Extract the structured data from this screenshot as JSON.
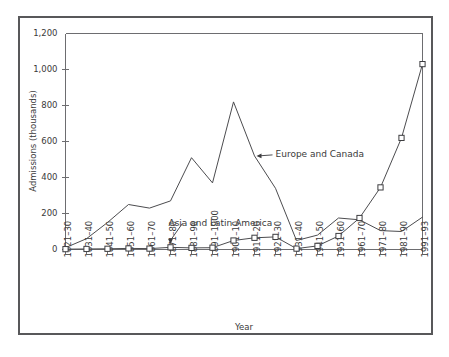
{
  "chart_data": {
    "type": "line",
    "title": "",
    "xlabel": "Year",
    "ylabel": "Admissions (thousands)",
    "ylim": [
      0,
      1200
    ],
    "yticks": [
      0,
      200,
      400,
      600,
      800,
      1000,
      1200
    ],
    "ytick_labels": [
      "0",
      "200",
      "400",
      "600",
      "800",
      "1,000",
      "1,200"
    ],
    "grid": false,
    "legend_position": "inline-annotations",
    "categories": [
      "1821–30",
      "1831–40",
      "1841–50",
      "1851–60",
      "1861–70",
      "1871–80",
      "1881–90",
      "1891–1900",
      "1901–10",
      "1911–20",
      "1921–30",
      "1931–40",
      "1941–50",
      "1951–60",
      "1961–70",
      "1971–80",
      "1981–90",
      "1991–93"
    ],
    "series": [
      {
        "name": "Europe and Canada",
        "marker": "none",
        "values": [
          10,
          60,
          150,
          250,
          230,
          270,
          510,
          370,
          820,
          520,
          340,
          50,
          80,
          175,
          165,
          105,
          100,
          180
        ]
      },
      {
        "name": "Asia and Latin America",
        "marker": "square",
        "values": [
          2,
          3,
          4,
          6,
          5,
          12,
          9,
          10,
          50,
          65,
          70,
          5,
          20,
          75,
          175,
          345,
          620,
          1030
        ]
      }
    ],
    "annotations": [
      {
        "text": "Europe and Canada",
        "target_category": "1911–20",
        "target_value": 520
      },
      {
        "text": "Asia and Latin America",
        "target_category": "1871–80",
        "target_value": 12
      }
    ]
  }
}
